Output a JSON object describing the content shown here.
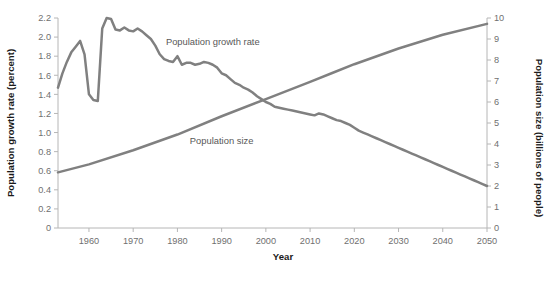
{
  "chart_data": {
    "type": "line",
    "title": "",
    "xlabel": "Year",
    "ylabel": "Population growth rate (percent)",
    "y2label": "Population size (billions of people)",
    "grid": false,
    "legend_position": "inline-annotations",
    "xlim": [
      1953,
      2050
    ],
    "ylim": [
      0,
      2.2
    ],
    "y2lim": [
      0,
      10
    ],
    "x_ticks": [
      1960,
      1970,
      1980,
      1990,
      2000,
      2010,
      2020,
      2030,
      2040,
      2050
    ],
    "x_tick_labels": [
      "1960",
      "1970",
      "1980",
      "1990",
      "2000",
      "2010",
      "2020",
      "2030",
      "2040",
      "2050"
    ],
    "y_ticks": [
      0,
      0.2,
      0.4,
      0.6,
      0.8,
      1.0,
      1.2,
      1.4,
      1.6,
      1.8,
      2.0,
      2.2
    ],
    "y_tick_labels": [
      "0",
      "0.2",
      "0.4",
      "0.6",
      "0.8",
      "1.0",
      "1.2",
      "1.4",
      "1.6",
      "1.8",
      "2.0",
      "2.2"
    ],
    "y2_ticks": [
      0,
      1,
      2,
      3,
      4,
      5,
      6,
      7,
      8,
      9,
      10
    ],
    "y2_tick_labels": [
      "0",
      "1",
      "2",
      "3",
      "4",
      "5",
      "6",
      "7",
      "8",
      "9",
      "10"
    ],
    "series": [
      {
        "name": "Population growth rate",
        "axis": "left",
        "units": "percent",
        "color": "#808080",
        "annotation": {
          "label": "Population growth rate",
          "x": 1988,
          "y": 1.92
        },
        "x": [
          1953,
          1954,
          1955,
          1956,
          1957,
          1958,
          1959,
          1960,
          1961,
          1962,
          1963,
          1964,
          1965,
          1966,
          1967,
          1968,
          1969,
          1970,
          1971,
          1972,
          1973,
          1974,
          1975,
          1976,
          1977,
          1978,
          1979,
          1980,
          1981,
          1982,
          1983,
          1984,
          1985,
          1986,
          1987,
          1988,
          1989,
          1990,
          1991,
          1992,
          1993,
          1994,
          1995,
          1996,
          1997,
          1998,
          1999,
          2000,
          2001,
          2002,
          2003,
          2004,
          2005,
          2006,
          2007,
          2008,
          2009,
          2010,
          2011,
          2012,
          2013,
          2014,
          2015,
          2016,
          2017,
          2018,
          2019,
          2020,
          2021,
          2022,
          2023,
          2024,
          2025,
          2026,
          2027,
          2028,
          2029,
          2030,
          2031,
          2032,
          2033,
          2034,
          2035,
          2036,
          2037,
          2038,
          2039,
          2040,
          2041,
          2042,
          2043,
          2044,
          2045,
          2046,
          2047,
          2048,
          2049,
          2050
        ],
        "y": [
          1.47,
          1.62,
          1.74,
          1.84,
          1.9,
          1.96,
          1.82,
          1.4,
          1.34,
          1.33,
          2.09,
          2.2,
          2.19,
          2.08,
          2.07,
          2.1,
          2.07,
          2.06,
          2.09,
          2.06,
          2.02,
          1.98,
          1.91,
          1.82,
          1.77,
          1.75,
          1.74,
          1.8,
          1.71,
          1.73,
          1.73,
          1.71,
          1.72,
          1.74,
          1.73,
          1.71,
          1.68,
          1.62,
          1.6,
          1.56,
          1.52,
          1.5,
          1.47,
          1.45,
          1.42,
          1.38,
          1.35,
          1.32,
          1.3,
          1.27,
          1.26,
          1.25,
          1.24,
          1.23,
          1.22,
          1.21,
          1.2,
          1.19,
          1.18,
          1.2,
          1.19,
          1.17,
          1.15,
          1.13,
          1.12,
          1.1,
          1.08,
          1.05,
          1.02,
          1.0,
          0.98,
          0.96,
          0.94,
          0.92,
          0.9,
          0.88,
          0.86,
          0.84,
          0.82,
          0.8,
          0.78,
          0.76,
          0.74,
          0.72,
          0.7,
          0.68,
          0.66,
          0.64,
          0.62,
          0.6,
          0.58,
          0.56,
          0.54,
          0.52,
          0.5,
          0.48,
          0.46,
          0.44
        ]
      },
      {
        "name": "Population size",
        "axis": "right",
        "units": "billions of people",
        "color": "#808080",
        "annotation": {
          "label": "Population size",
          "x": 1990,
          "y_right": 4.0
        },
        "x": [
          1953,
          1960,
          1970,
          1980,
          1990,
          2000,
          2010,
          2015,
          2020,
          2030,
          2040,
          2050
        ],
        "y": [
          2.65,
          3.03,
          3.7,
          4.45,
          5.32,
          6.14,
          6.96,
          7.38,
          7.8,
          8.55,
          9.2,
          9.72
        ]
      }
    ]
  }
}
